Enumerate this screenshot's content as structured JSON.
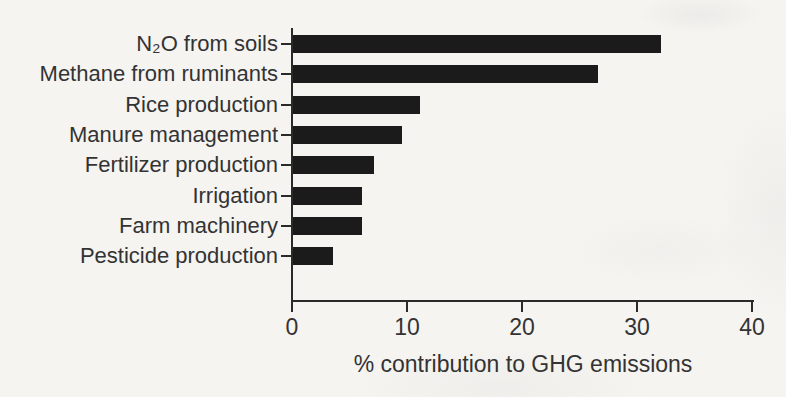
{
  "chart_data": {
    "type": "bar",
    "orientation": "horizontal",
    "categories": [
      "N₂O from soils",
      "Methane from ruminants",
      "Rice production",
      "Manure management",
      "Fertilizer production",
      "Irrigation",
      "Farm machinery",
      "Pesticide production"
    ],
    "values": [
      32,
      26.5,
      11,
      9.5,
      7,
      6,
      6,
      3.5
    ],
    "title": "",
    "xlabel": "% contribution to GHG emissions",
    "ylabel": "",
    "xlim": [
      0,
      40
    ],
    "xticks": [
      0,
      10,
      20,
      30,
      40
    ],
    "xtick_labels": [
      "0",
      "10",
      "20",
      "30",
      "40"
    ],
    "grid": false,
    "legend": null
  },
  "colors": {
    "background": "#f5f4f1",
    "bar": "#1b1b1b",
    "axis": "#2a2a2a",
    "text": "#333333"
  }
}
